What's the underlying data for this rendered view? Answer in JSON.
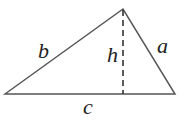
{
  "diagram": {
    "type": "triangle-with-altitude",
    "labels": {
      "side_left": "b",
      "side_right": "a",
      "base": "c",
      "altitude": "h"
    },
    "colors": {
      "stroke": "#555555",
      "text": "#222222"
    }
  }
}
